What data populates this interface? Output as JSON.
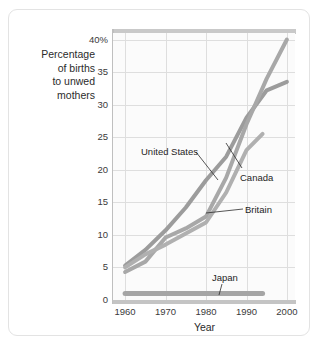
{
  "figure": {
    "y_axis_title": "Percentage\nof births\nto unwed\nmothers",
    "x_axis_title": "Year"
  },
  "annotations": {
    "united_states": "United States",
    "canada": "Canada",
    "britain": "Britain",
    "japan": "Japan"
  },
  "caption": "",
  "chart_data": {
    "type": "line",
    "title": "",
    "xlabel": "Year",
    "ylabel": "Percentage of births to unwed mothers",
    "xlim": [
      1957,
      2002
    ],
    "ylim": [
      0,
      41
    ],
    "grid": true,
    "legend_position": "inline-annotations",
    "xtick_labels": [
      "1960",
      "1970",
      "1980",
      "1990",
      "2000"
    ],
    "xticks": [
      1960,
      1970,
      1980,
      1990,
      2000
    ],
    "ytick_labels": [
      "0",
      "5",
      "10",
      "15",
      "20",
      "25",
      "30",
      "35",
      "40%"
    ],
    "yticks": [
      0,
      5,
      10,
      15,
      20,
      25,
      30,
      35,
      40
    ],
    "series": [
      {
        "name": "United States",
        "color": "#9c9c9c",
        "x": [
          1960,
          1965,
          1970,
          1975,
          1980,
          1985,
          1990,
          1995,
          2000
        ],
        "values": [
          5.3,
          7.7,
          10.7,
          14.2,
          18.4,
          22.0,
          28.0,
          32.2,
          33.5
        ]
      },
      {
        "name": "Canada",
        "color": "#a8a8a8",
        "x": [
          1960,
          1965,
          1970,
          1975,
          1980,
          1985,
          1990,
          1995,
          2000
        ],
        "values": [
          4.3,
          5.9,
          9.6,
          11.0,
          12.8,
          18.8,
          27.0,
          34.0,
          40.0
        ]
      },
      {
        "name": "Britain",
        "color": "#b0b0b0",
        "x": [
          1960,
          1965,
          1970,
          1975,
          1980,
          1985,
          1990,
          1994
        ],
        "values": [
          5.0,
          7.0,
          8.5,
          10.2,
          11.9,
          16.5,
          23.0,
          25.5
        ]
      },
      {
        "name": "Japan",
        "color": "#a5a5a5",
        "x": [
          1960,
          1970,
          1980,
          1990,
          1994
        ],
        "values": [
          1.0,
          1.0,
          1.0,
          1.0,
          1.0
        ]
      }
    ]
  }
}
